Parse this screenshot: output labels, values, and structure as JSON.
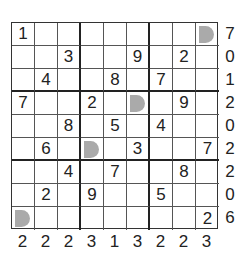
{
  "puzzle": {
    "grid": [
      [
        "1",
        "",
        "",
        "",
        "",
        "",
        "",
        "",
        "M"
      ],
      [
        "",
        "",
        "3",
        "",
        "",
        "9",
        "",
        "2",
        ""
      ],
      [
        "",
        "4",
        "",
        "",
        "8",
        "",
        "7",
        "",
        ""
      ],
      [
        "7",
        "",
        "",
        "2",
        "",
        "M",
        "",
        "9",
        ""
      ],
      [
        "",
        "",
        "8",
        "",
        "5",
        "",
        "4",
        "",
        ""
      ],
      [
        "",
        "6",
        "",
        "M",
        "",
        "3",
        "",
        "",
        "7"
      ],
      [
        "",
        "",
        "4",
        "",
        "7",
        "",
        "",
        "8",
        ""
      ],
      [
        "",
        "2",
        "",
        "9",
        "",
        "",
        "5",
        "",
        ""
      ],
      [
        "M",
        "",
        "",
        "",
        "",
        "",
        "",
        "",
        "2"
      ]
    ],
    "marker_legend": "M = grey half-round marker",
    "row_clues": [
      "7",
      "0",
      "1",
      "2",
      "0",
      "2",
      "2",
      "0",
      "6"
    ],
    "col_clues": [
      "2",
      "2",
      "2",
      "3",
      "1",
      "3",
      "2",
      "2",
      "3"
    ],
    "colors": {
      "marker": "#aaaaaa",
      "lines": "#333333",
      "text": "#222222"
    }
  }
}
